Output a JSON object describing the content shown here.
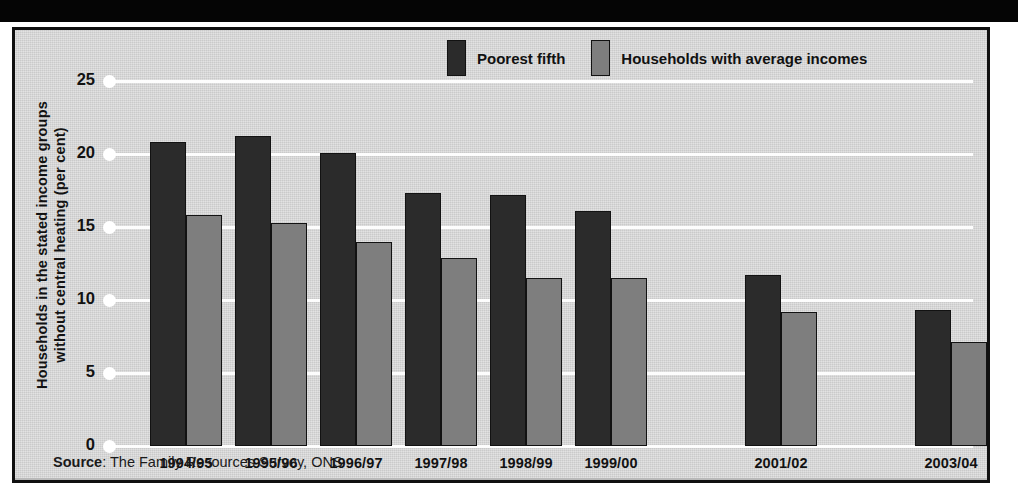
{
  "chart_data": {
    "type": "bar",
    "title": "",
    "xlabel": "",
    "ylabel": "Households in the stated income groups without central heating (per cent)",
    "ylabel_lines": [
      "Households in the stated income groups",
      "without central heating (per cent)"
    ],
    "categories": [
      "1994/95",
      "1995/96",
      "1996/97",
      "1997/98",
      "1998/99",
      "1999/00",
      "2001/02",
      "2003/04"
    ],
    "series": [
      {
        "name": "Poorest fifth",
        "color": "#2b2b2b",
        "values": [
          20.8,
          21.2,
          20.1,
          17.3,
          17.2,
          16.1,
          11.7,
          9.3
        ]
      },
      {
        "name": "Households with average incomes",
        "color": "#7e7e7e",
        "values": [
          15.8,
          15.3,
          14.0,
          12.9,
          11.5,
          11.5,
          9.2,
          7.1
        ]
      }
    ],
    "ylim": [
      0,
      25
    ],
    "yticks": [
      0,
      5,
      10,
      15,
      20,
      25
    ],
    "ytick_labels": [
      "0",
      "5",
      "10",
      "15",
      "20",
      "25"
    ],
    "grid": true,
    "grid_color": "#fdfdfd",
    "legend_position": "top-right",
    "category_gaps_after": [
      "1999/00",
      "2001/02"
    ],
    "source": {
      "label": "Source",
      "separator": ": ",
      "text": "The Family Resources Survey, ONS",
      "full": "Source: The Family Resources Survey, ONS"
    }
  },
  "panel": {
    "background": "#d8d8d8",
    "border_color": "#101010",
    "top_band_color": "#050505"
  },
  "legend": {
    "items": [
      {
        "label": "Poorest fifth",
        "color": "#2b2b2b"
      },
      {
        "label": "Households with average incomes",
        "color": "#7e7e7e"
      }
    ]
  }
}
